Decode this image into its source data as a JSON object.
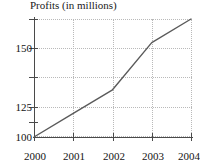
{
  "chart_data": {
    "type": "line",
    "title": "Profits (in millions)",
    "xlabel": "",
    "ylabel": "",
    "x": [
      2000,
      2001,
      2002,
      2003,
      2004
    ],
    "categories": [
      "2000",
      "2001",
      "2002",
      "2003",
      "2004"
    ],
    "values": [
      100,
      112.5,
      125,
      150,
      162.5
    ],
    "series": [
      {
        "name": "Profits",
        "values": [
          100,
          112.5,
          125,
          150,
          162.5
        ],
        "color": "#5a5a5a"
      }
    ],
    "xlim": [
      2000,
      2004
    ],
    "ylim": [
      100,
      162.5
    ],
    "y_major_ticks": [
      100,
      125,
      150
    ],
    "y_major_labels": [
      "100",
      "125",
      "150"
    ],
    "y_minor_ticks": [
      112.5,
      137.5,
      162.5
    ],
    "x_ticks": [
      2000,
      2001,
      2002,
      2003,
      2004
    ],
    "grid": true,
    "grid_color": "#b9b9b9",
    "legend": false,
    "axis_color": "#4a4a4a",
    "background": "#ffffff"
  },
  "labels": {
    "y": [
      "150",
      "125",
      "100"
    ],
    "x": [
      "2000",
      "2001",
      "2002",
      "2003",
      "2004"
    ]
  }
}
